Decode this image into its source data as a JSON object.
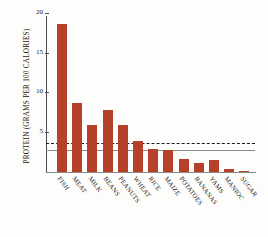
{
  "chart_data": {
    "type": "bar",
    "title": "",
    "xlabel": "",
    "ylabel": "PROTEIN (GRAMS PER 100 CALORIES)",
    "categories": [
      "FISH",
      "MEAT",
      "MILK",
      "BEANS",
      "PEANUTS",
      "WHEAT",
      "RICE",
      "MAIZE",
      "POTATOES",
      "BANANAS",
      "YAMS",
      "MANIOC",
      "SUGAR"
    ],
    "values": [
      18.7,
      8.7,
      5.9,
      7.9,
      6.0,
      3.9,
      2.9,
      2.8,
      1.6,
      1.1,
      1.5,
      0.4,
      0.1
    ],
    "ylim": [
      0,
      20
    ],
    "yticks": [
      5,
      10,
      15,
      20
    ],
    "ytick_labels": [
      "5",
      "10",
      "15",
      "20"
    ],
    "grid": false,
    "legend": "none",
    "bar_color": "#b5412b",
    "reference_lines": [
      {
        "name": "dashed-upper",
        "value": 3.6,
        "style": "dashed",
        "color": "#1c1c1c"
      },
      {
        "name": "solid-lower",
        "value": 2.6,
        "style": "solid",
        "color": "#8c8c8c"
      }
    ]
  }
}
